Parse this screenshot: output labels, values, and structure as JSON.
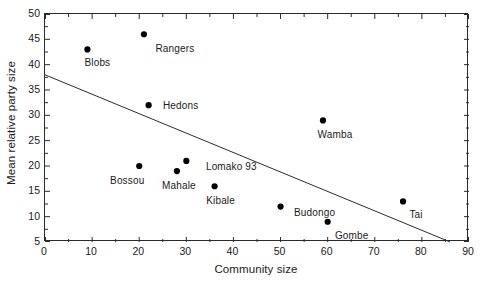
{
  "chart_data": {
    "type": "scatter",
    "title": "",
    "xlabel": "Community size",
    "ylabel": "Mean relative party size",
    "xlim": [
      0,
      90
    ],
    "ylim": [
      5,
      50
    ],
    "xticks": [
      0,
      10,
      20,
      30,
      40,
      50,
      60,
      70,
      80,
      90
    ],
    "yticks": [
      5,
      10,
      15,
      20,
      25,
      30,
      35,
      40,
      45,
      50
    ],
    "xtick_labels": [
      "0",
      "10",
      "20",
      "30",
      "40",
      "50",
      "60",
      "70",
      "80",
      "90"
    ],
    "ytick_labels": [
      "5",
      "10",
      "15",
      "20",
      "25",
      "30",
      "35",
      "40",
      "45",
      "50"
    ],
    "minor_ticks": true,
    "grid": false,
    "legend": null,
    "marker": "filled-circle",
    "marker_color": "#000000",
    "axis_color": "#2b2b2b",
    "points": [
      {
        "label": "Blobs",
        "x": 9,
        "y": 43,
        "label_dx": 10,
        "label_dy": 13
      },
      {
        "label": "Rangers",
        "x": 21,
        "y": 46,
        "label_dx": 31,
        "label_dy": 14
      },
      {
        "label": "Hedons",
        "x": 22,
        "y": 32,
        "label_dx": 32,
        "label_dy": 0
      },
      {
        "label": "Bossou",
        "x": 20,
        "y": 20,
        "label_dx": -12,
        "label_dy": 14
      },
      {
        "label": "Mahale",
        "x": 28,
        "y": 19,
        "label_dx": 2,
        "label_dy": 14
      },
      {
        "label": "Lomako 93",
        "x": 30,
        "y": 21,
        "label_dx": 45,
        "label_dy": 5
      },
      {
        "label": "Kibale",
        "x": 36,
        "y": 16,
        "label_dx": 6,
        "label_dy": 14
      },
      {
        "label": "Wamba",
        "x": 59,
        "y": 29,
        "label_dx": 12,
        "label_dy": 14
      },
      {
        "label": "Budongo",
        "x": 50,
        "y": 12,
        "label_dx": 34,
        "label_dy": 5
      },
      {
        "label": "Gombe",
        "x": 60,
        "y": 9,
        "label_dx": 24,
        "label_dy": 13
      },
      {
        "label": "Tai",
        "x": 76,
        "y": 13,
        "label_dx": 13,
        "label_dy": 13
      }
    ],
    "trendline": {
      "name": "regression-line",
      "x_start": 0,
      "y_start": 38,
      "x_end": 86,
      "y_end": 5,
      "color": "#2b2b2b"
    }
  }
}
